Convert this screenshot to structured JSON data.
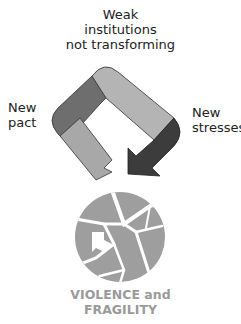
{
  "diagram": {
    "labels": {
      "top": [
        "Weak",
        "institutions",
        "not transforming"
      ],
      "left": [
        "New",
        "pact"
      ],
      "right": [
        "New",
        "stresses"
      ]
    },
    "cycle_segments": [
      {
        "name": "new-pact",
        "color": "#6e6e6e"
      },
      {
        "name": "weak-institutions",
        "color": "#b0b0b0"
      },
      {
        "name": "new-stresses",
        "color": "#3c3c3c"
      },
      {
        "name": "return-to-pact",
        "color": "#a8a8a8"
      }
    ],
    "outcome": {
      "icon": "broken-circle-icon",
      "color": "#9e9e9e",
      "label": [
        "VIOLENCE and",
        "FRAGILITY"
      ]
    }
  }
}
